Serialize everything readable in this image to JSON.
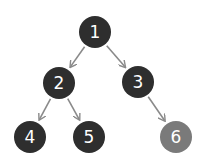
{
  "diagram": {
    "type": "binary-tree",
    "colors": {
      "node_dark": "#2e2e2e",
      "node_highlight": "#7a7a7a",
      "edge": "#8a8a8a",
      "label": "#ffffff"
    },
    "nodes": [
      {
        "id": "1",
        "label": "1",
        "x": 95,
        "y": 32,
        "highlight": false
      },
      {
        "id": "2",
        "label": "2",
        "x": 59,
        "y": 83,
        "highlight": false
      },
      {
        "id": "3",
        "label": "3",
        "x": 138,
        "y": 82,
        "highlight": false
      },
      {
        "id": "4",
        "label": "4",
        "x": 30,
        "y": 137,
        "highlight": false
      },
      {
        "id": "5",
        "label": "5",
        "x": 89,
        "y": 137,
        "highlight": false
      },
      {
        "id": "6",
        "label": "6",
        "x": 176,
        "y": 137,
        "highlight": true
      }
    ],
    "edges": [
      {
        "from": "1",
        "to": "2"
      },
      {
        "from": "1",
        "to": "3"
      },
      {
        "from": "2",
        "to": "4"
      },
      {
        "from": "2",
        "to": "5"
      },
      {
        "from": "3",
        "to": "6"
      }
    ]
  }
}
